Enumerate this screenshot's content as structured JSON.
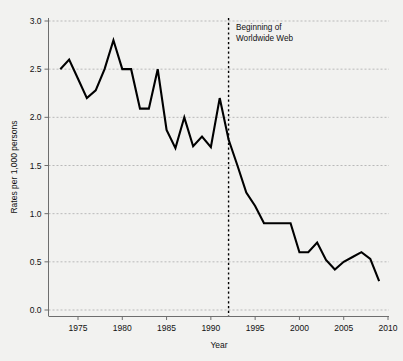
{
  "chart_data": {
    "type": "line",
    "title": "",
    "subtitle": "",
    "xlabel": "Year",
    "ylabel": "Rates per 1,000 persons",
    "xlim": [
      1972,
      2010.5
    ],
    "ylim": [
      0.0,
      3.0
    ],
    "grid": true,
    "legend": null,
    "line_color": "#000000",
    "grid_color": "#b9b9b9",
    "axis_color": "#6e6e6e",
    "background_color": "#f2f2f0",
    "x": [
      1973,
      1974,
      1975,
      1976,
      1977,
      1978,
      1979,
      1980,
      1981,
      1982,
      1983,
      1984,
      1985,
      1986,
      1987,
      1988,
      1989,
      1990,
      1991,
      1992,
      1993,
      1994,
      1995,
      1996,
      1997,
      1998,
      1999,
      2000,
      2001,
      2002,
      2003,
      2004,
      2005,
      2006,
      2007,
      2008,
      2009
    ],
    "values": [
      2.5,
      2.6,
      2.4,
      2.2,
      2.28,
      2.5,
      2.8,
      2.5,
      2.5,
      2.09,
      2.09,
      2.5,
      1.87,
      1.68,
      2.0,
      1.7,
      1.8,
      1.69,
      2.2,
      1.77,
      1.5,
      1.22,
      1.08,
      0.9,
      0.9,
      0.9,
      0.9,
      0.6,
      0.6,
      0.7,
      0.52,
      0.42,
      0.5,
      0.55,
      0.6,
      0.53,
      0.3
    ],
    "series": [
      {
        "name": "Rate",
        "values": [
          2.5,
          2.6,
          2.4,
          2.2,
          2.28,
          2.5,
          2.8,
          2.5,
          2.5,
          2.09,
          2.09,
          2.5,
          1.87,
          1.68,
          2.0,
          1.7,
          1.8,
          1.69,
          2.2,
          1.77,
          1.5,
          1.22,
          1.08,
          0.9,
          0.9,
          0.9,
          0.9,
          0.6,
          0.6,
          0.7,
          0.52,
          0.42,
          0.5,
          0.55,
          0.6,
          0.53,
          0.3
        ]
      }
    ],
    "yticks": [
      0.0,
      0.5,
      1.0,
      1.5,
      2.0,
      2.5,
      3.0
    ],
    "ytick_labels": [
      "0.0",
      "0.5",
      "1.0",
      "1.5",
      "2.0",
      "2.5",
      "3.0"
    ],
    "xticks": [
      1975,
      1980,
      1985,
      1990,
      1995,
      2000,
      2005,
      2010
    ],
    "xtick_labels": [
      "1975",
      "1980",
      "1985",
      "1990",
      "1995",
      "2000",
      "2005",
      "2010"
    ],
    "annotations": [
      {
        "type": "vline",
        "x": 1992,
        "style": "dotted",
        "color": "#000000",
        "label_line1": "Beginning of",
        "label_line2": "Worldwide Web"
      }
    ]
  },
  "axes": {
    "y_title": "Rates per 1,000 persons",
    "x_title": "Year"
  },
  "annotation": {
    "line1": "Beginning of",
    "line2": "Worldwide Web"
  }
}
